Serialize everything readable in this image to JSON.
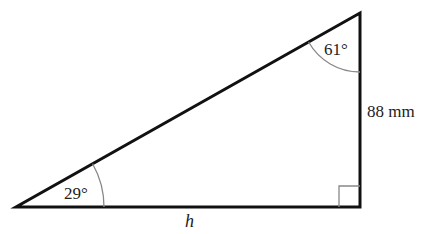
{
  "diagram": {
    "type": "right-triangle",
    "angles": {
      "left": "29°",
      "top": "61°"
    },
    "sides": {
      "vertical": "88 mm",
      "base": "h"
    },
    "right_angle_marker": true,
    "colors": {
      "line": "#111111",
      "arc": "#888888",
      "text": "#222222"
    }
  }
}
